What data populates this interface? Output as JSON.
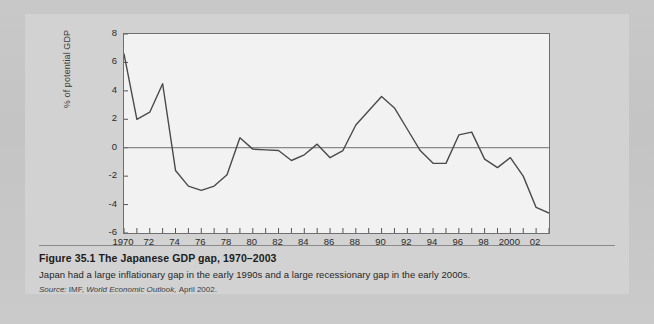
{
  "figure": {
    "caption_title": "Figure 35.1  The Japanese GDP gap, 1970–2003",
    "caption_description": "Japan had a large inflationary gap in the early 1990s and a large recessionary gap in the early 2000s.",
    "source_label": "Source:",
    "source_org": "IMF,",
    "source_publication": "World Economic Outlook,",
    "source_date": "April 2002."
  },
  "chart_data": {
    "type": "line",
    "title": "The Japanese GDP gap, 1970–2003",
    "xlabel": "",
    "ylabel": "% of potential GDP",
    "xlim": [
      1970,
      2003
    ],
    "ylim": [
      -6,
      8
    ],
    "grid": false,
    "legend": "none",
    "zero_line": true,
    "line_color": "#4a4a4a",
    "panel_color": "#f2f2f2",
    "y_ticks": [
      8,
      6,
      4,
      2,
      0,
      -2,
      -4,
      -6
    ],
    "y_tick_labels": [
      "8",
      "6",
      "4",
      "2",
      "0",
      "-2",
      "-4",
      "-6"
    ],
    "x_ticks": [
      1970,
      1972,
      1974,
      1976,
      1978,
      1980,
      1982,
      1984,
      1986,
      1988,
      1990,
      1992,
      1994,
      1996,
      1998,
      2000,
      2002
    ],
    "x_tick_labels": [
      "1970",
      "72",
      "74",
      "76",
      "78",
      "80",
      "82",
      "84",
      "86",
      "88",
      "90",
      "92",
      "94",
      "96",
      "98",
      "2000",
      "02"
    ],
    "x_minor_tick_step": 1,
    "series": [
      {
        "name": "GDP gap",
        "x": [
          1970,
          1971,
          1972,
          1973,
          1974,
          1975,
          1976,
          1977,
          1978,
          1979,
          1980,
          1981,
          1982,
          1983,
          1984,
          1985,
          1986,
          1987,
          1988,
          1989,
          1990,
          1991,
          1992,
          1993,
          1994,
          1995,
          1996,
          1997,
          1998,
          1999,
          2000,
          2001,
          2002,
          2003
        ],
        "values": [
          6.6,
          2.0,
          2.5,
          4.5,
          -1.6,
          -2.7,
          -3.0,
          -2.7,
          -1.9,
          0.7,
          -0.1,
          -0.15,
          -0.2,
          -0.9,
          -0.5,
          0.25,
          -0.7,
          -0.2,
          1.6,
          2.6,
          3.6,
          2.8,
          1.3,
          -0.2,
          -1.1,
          -1.1,
          0.9,
          1.1,
          -0.8,
          -1.4,
          -0.7,
          -2.0,
          -4.2,
          -4.6
        ]
      }
    ]
  }
}
